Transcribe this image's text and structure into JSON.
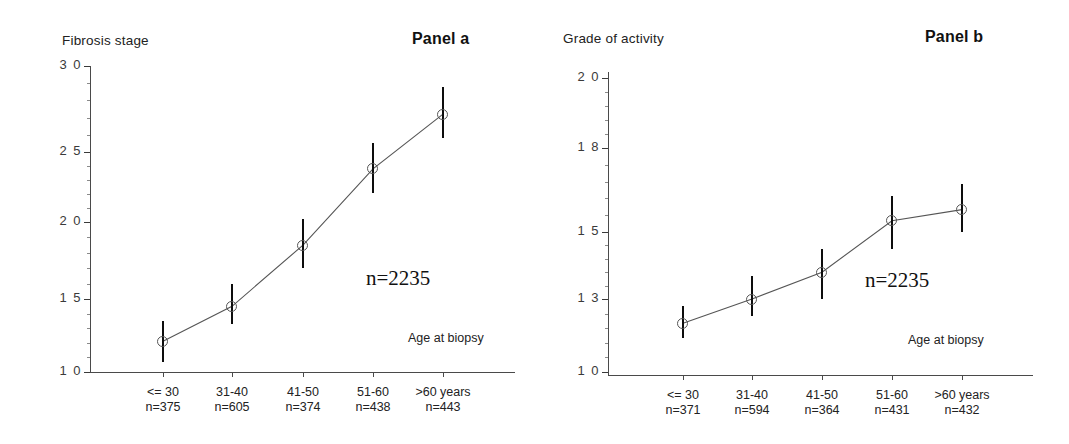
{
  "figure": {
    "width": 1069,
    "height": 444,
    "background": "#ffffff",
    "line_color": "#555555",
    "error_bar_color": "#0d0d0d"
  },
  "panels": [
    {
      "id": "panel-a",
      "panel_label": "Panel a",
      "y_axis_title": "Fibrosis stage",
      "x_axis_caption": "Age at biopsy",
      "total_n_label": "n=2235"
    },
    {
      "id": "panel-b",
      "panel_label": "Panel b",
      "y_axis_title": "Grade of activity",
      "x_axis_caption": "Age at biopsy",
      "total_n_label": "n=2235"
    }
  ],
  "chart_data": [
    {
      "type": "line",
      "title": "Panel a",
      "ylabel": "Fibrosis stage",
      "xlabel": "Age at biopsy",
      "ylim": [
        1.0,
        3.0
      ],
      "ytick_labels": [
        "3 0",
        "2 5",
        "2 0",
        "1 5",
        "1 0"
      ],
      "ytick_values": [
        3.0,
        2.5,
        2.0,
        1.5,
        1.0
      ],
      "grid": false,
      "legend": "none",
      "total_n": 2235,
      "categories": [
        "<= 30",
        "31-40",
        "41-50",
        "51-60",
        ">60 years"
      ],
      "category_counts": [
        "n=375",
        "n=605",
        "n=374",
        "n=438",
        "n=443"
      ],
      "values": [
        1.21,
        1.45,
        1.85,
        2.38,
        2.72
      ],
      "error_low": [
        1.07,
        1.33,
        1.7,
        2.21,
        2.58
      ],
      "error_high": [
        1.35,
        1.6,
        2.02,
        2.55,
        2.88
      ]
    },
    {
      "type": "line",
      "title": "Panel b",
      "ylabel": "Grade of activity",
      "xlabel": "Age at biopsy",
      "ylim": [
        1.0,
        2.0
      ],
      "ytick_labels": [
        "2 0",
        "1 8",
        "1 5",
        "1 3",
        "1 0"
      ],
      "ytick_values": [
        2.0,
        1.8,
        1.5,
        1.3,
        1.0
      ],
      "grid": false,
      "legend": "none",
      "total_n": 2235,
      "categories": [
        "<= 30",
        "31-40",
        "41-50",
        "51-60",
        ">60 years"
      ],
      "category_counts": [
        "n=371",
        "n=594",
        "n=364",
        "n=431",
        "n=432"
      ],
      "values": [
        1.2,
        1.3,
        1.38,
        1.54,
        1.58
      ],
      "error_low": [
        1.14,
        1.23,
        1.3,
        1.45,
        1.5
      ],
      "error_high": [
        1.27,
        1.37,
        1.45,
        1.63,
        1.67
      ]
    }
  ]
}
